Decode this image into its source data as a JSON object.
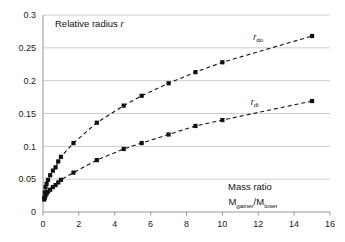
{
  "chart_data": {
    "type": "scatter",
    "title": "",
    "ylabel": "Relative radius  r",
    "xlabel_line1": "Mass ratio",
    "xlabel_line2_main1": "M",
    "xlabel_line2_sub1": "gainer",
    "xlabel_line2_slash": "/M",
    "xlabel_line2_sub2": "loser",
    "xlim": [
      0,
      16
    ],
    "ylim": [
      0,
      0.3
    ],
    "xticks": [
      0,
      2,
      4,
      6,
      8,
      10,
      12,
      14,
      16
    ],
    "xtick_labels": [
      "0",
      "2",
      "4",
      "6",
      "8",
      "10",
      "12",
      "14",
      "16"
    ],
    "yticks": [
      0,
      0.05,
      0.1,
      0.15,
      0.2,
      0.25,
      0.3
    ],
    "ytick_labels": [
      "0",
      "0.05",
      "0.1",
      "0.15",
      "0.2",
      "0.25",
      "0.3"
    ],
    "grid": "horizontal",
    "legend_position": "inline-annotation",
    "marker": "square",
    "line_style": "dashed",
    "series": [
      {
        "name": "r_do",
        "label_main": "r",
        "label_sub": "do",
        "label_x": 12.0,
        "label_y": 0.262,
        "x": [
          0.07,
          0.1,
          0.14,
          0.2,
          0.28,
          0.4,
          0.55,
          0.7,
          0.85,
          1.0,
          1.7,
          3.0,
          4.5,
          5.5,
          7.0,
          8.5,
          10.0,
          15.0
        ],
        "y": [
          0.022,
          0.03,
          0.038,
          0.043,
          0.049,
          0.056,
          0.063,
          0.068,
          0.077,
          0.084,
          0.105,
          0.136,
          0.162,
          0.177,
          0.196,
          0.213,
          0.228,
          0.268
        ]
      },
      {
        "name": "r_di",
        "label_main": "r",
        "label_sub": "di",
        "label_x": 11.8,
        "label_y": 0.163,
        "x": [
          0.07,
          0.1,
          0.14,
          0.2,
          0.28,
          0.4,
          0.55,
          0.7,
          0.85,
          1.0,
          1.7,
          3.0,
          4.5,
          5.5,
          7.0,
          8.5,
          10.0,
          15.0
        ],
        "y": [
          0.019,
          0.022,
          0.025,
          0.028,
          0.031,
          0.034,
          0.038,
          0.041,
          0.045,
          0.049,
          0.06,
          0.079,
          0.096,
          0.105,
          0.118,
          0.131,
          0.14,
          0.169
        ]
      }
    ]
  },
  "colors": {
    "marker": "#111111",
    "line": "#111111",
    "grid": "#b8b8b8",
    "axis": "#8a8a8a",
    "background": "#ffffff",
    "text": "#1a1a1a"
  }
}
